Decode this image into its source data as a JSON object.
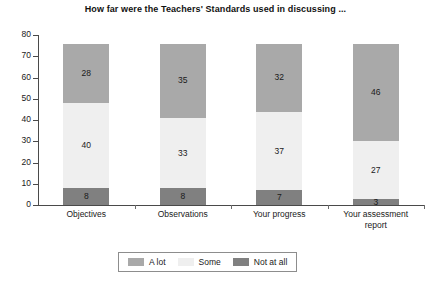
{
  "chart_data": {
    "type": "bar",
    "subtype": "stacked-bar",
    "title": "How far were the Teachers' Standards used in discussing ...",
    "xlabel": "",
    "ylabel": "",
    "ylim": [
      0,
      80
    ],
    "ytick_step": 10,
    "yticks": [
      80,
      70,
      60,
      50,
      40,
      30,
      20,
      10,
      0
    ],
    "grid": false,
    "legend_position": "bottom",
    "categories": [
      "Objectives",
      "Observations",
      "Your progress",
      "Your assessment report"
    ],
    "category_lines": [
      [
        "Objectives"
      ],
      [
        "Observations"
      ],
      [
        "Your progress"
      ],
      [
        "Your assessment",
        "report"
      ]
    ],
    "series": [
      {
        "name": "Not at all",
        "color": "#808080",
        "values": [
          8,
          8,
          7,
          3
        ]
      },
      {
        "name": "Some",
        "color": "#efefef",
        "values": [
          40,
          33,
          37,
          27
        ]
      },
      {
        "name": "A lot",
        "color": "#a9a9a9",
        "values": [
          28,
          35,
          32,
          46
        ]
      }
    ],
    "stack_order_bottom_to_top": [
      "Not at all",
      "Some",
      "A lot"
    ],
    "totals": [
      76,
      76,
      76,
      76
    ]
  },
  "legend": {
    "items": [
      {
        "label": "A lot",
        "color": "#a9a9a9"
      },
      {
        "label": "Some",
        "color": "#efefef"
      },
      {
        "label": "Not at all",
        "color": "#808080"
      }
    ]
  },
  "colors": {
    "a_lot": "#a9a9a9",
    "some": "#efefef",
    "not_at_all": "#808080",
    "axis": "#4a4a4a",
    "text": "#1a1a1a",
    "background": "#ffffff",
    "legend_border": "#8d8d8d"
  }
}
